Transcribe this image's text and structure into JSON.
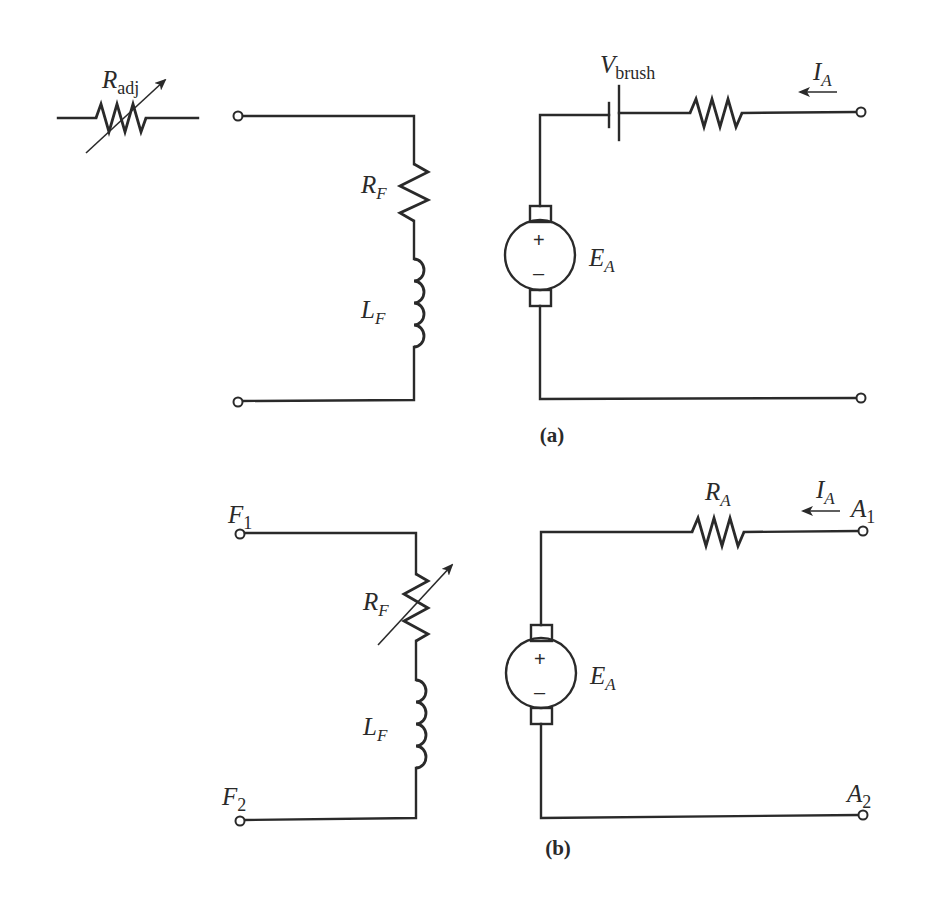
{
  "figure": {
    "panel_a": {
      "caption": "(a)",
      "r_adj": {
        "main": "R",
        "sub": "adj"
      },
      "r_f": {
        "main": "R",
        "sub": "F"
      },
      "l_f": {
        "main": "L",
        "sub": "F"
      },
      "v_brush": {
        "main": "V",
        "sub": "brush"
      },
      "i_a": {
        "main": "I",
        "sub": "A"
      },
      "e_a": {
        "main": "E",
        "sub": "A"
      },
      "plus": "+",
      "minus": "–"
    },
    "panel_b": {
      "caption": "(b)",
      "f1": {
        "main": "F",
        "sub": "1"
      },
      "f2": {
        "main": "F",
        "sub": "2"
      },
      "r_f": {
        "main": "R",
        "sub": "F"
      },
      "l_f": {
        "main": "L",
        "sub": "F"
      },
      "r_a": {
        "main": "R",
        "sub": "A"
      },
      "i_a": {
        "main": "I",
        "sub": "A"
      },
      "a1": {
        "main": "A",
        "sub": "1"
      },
      "a2": {
        "main": "A",
        "sub": "2"
      },
      "e_a": {
        "main": "E",
        "sub": "A"
      },
      "plus": "+",
      "minus": "–"
    },
    "colors": {
      "ink": "#2a2a2a",
      "background": "#ffffff"
    }
  }
}
